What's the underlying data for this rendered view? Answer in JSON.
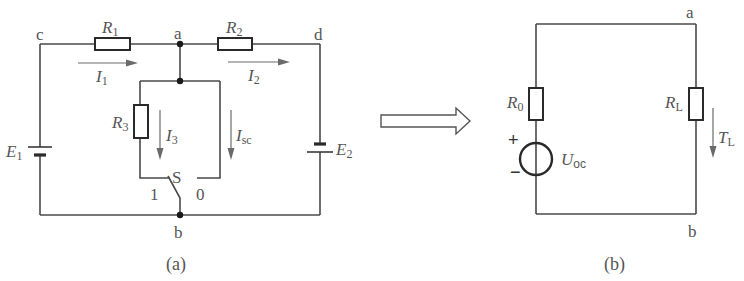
{
  "figure_a": {
    "caption": "(a)",
    "nodes": {
      "c": "c",
      "a": "a",
      "d": "d",
      "b": "b"
    },
    "resistors": {
      "r1": {
        "main": "R",
        "sub": "1"
      },
      "r2": {
        "main": "R",
        "sub": "2"
      },
      "r3": {
        "main": "R",
        "sub": "3"
      }
    },
    "sources": {
      "e1": {
        "main": "E",
        "sub": "1"
      },
      "e2": {
        "main": "E",
        "sub": "2"
      }
    },
    "currents": {
      "i1": {
        "main": "I",
        "sub": "1"
      },
      "i2": {
        "main": "I",
        "sub": "2"
      },
      "i3": {
        "main": "I",
        "sub": "3"
      },
      "isc": {
        "main": "I",
        "sub": "sc"
      }
    },
    "switch": {
      "label": "S",
      "pos1": "1",
      "pos0": "0"
    }
  },
  "transform_arrow": {
    "icon": "right-arrow-icon"
  },
  "figure_b": {
    "caption": "(b)",
    "nodes": {
      "a": "a",
      "b": "b"
    },
    "resistors": {
      "r0": {
        "main": "R",
        "sub": "0"
      },
      "rl": {
        "main": "R",
        "sub": "L"
      }
    },
    "source": {
      "main": "U",
      "sub": "oc",
      "plus": "+",
      "minus": "−"
    },
    "current": {
      "main": "T",
      "sub": "L"
    }
  }
}
